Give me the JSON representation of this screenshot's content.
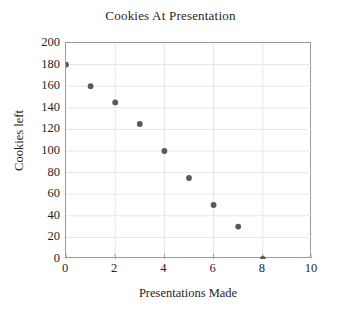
{
  "chart_data": {
    "type": "scatter",
    "title": "Cookies At Presentation",
    "xlabel": "Presentations Made",
    "ylabel": "Cookies left",
    "xlim": [
      0,
      10
    ],
    "ylim": [
      0,
      200
    ],
    "xticks": [
      0,
      2,
      4,
      6,
      8,
      10
    ],
    "yticks": [
      0,
      20,
      40,
      60,
      80,
      100,
      120,
      140,
      160,
      180,
      200
    ],
    "grid": true,
    "legend": false,
    "marker_color": "#595959",
    "gridline_color": "#e6e6e6",
    "axis_color": "#9a9a9a",
    "background_color": "#ffffff",
    "series": [
      {
        "name": "Cookies left",
        "x": [
          0,
          1,
          2,
          3,
          4,
          5,
          6,
          7,
          8
        ],
        "y": [
          180,
          160,
          145,
          125,
          100,
          75,
          50,
          30,
          0
        ],
        "points": [
          {
            "x": 0,
            "y": 180
          },
          {
            "x": 1,
            "y": 160
          },
          {
            "x": 2,
            "y": 145
          },
          {
            "x": 3,
            "y": 125
          },
          {
            "x": 4,
            "y": 100
          },
          {
            "x": 5,
            "y": 75
          },
          {
            "x": 6,
            "y": 50
          },
          {
            "x": 7,
            "y": 30
          },
          {
            "x": 8,
            "y": 0
          }
        ]
      }
    ]
  }
}
